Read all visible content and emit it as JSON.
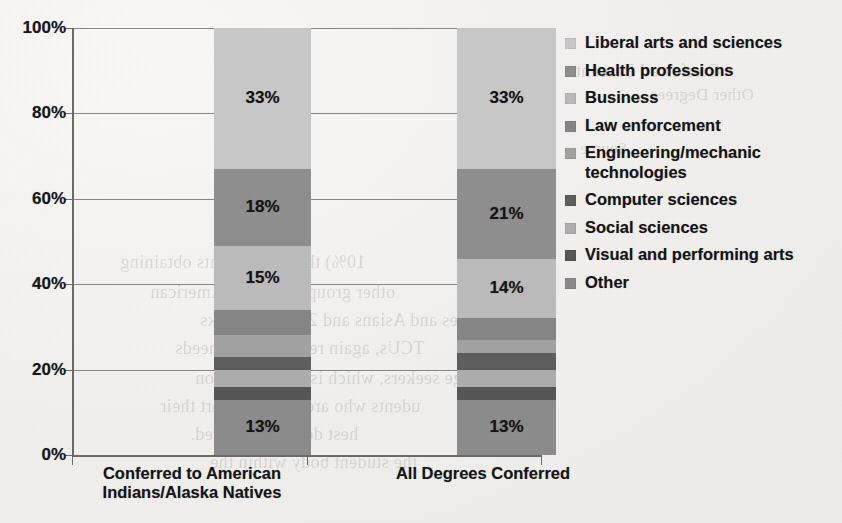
{
  "chart_data": {
    "type": "bar",
    "subtype": "stacked-percent-100",
    "title": "",
    "xlabel": "",
    "ylabel": "",
    "ylim": [
      0,
      100
    ],
    "ytick_labels": [
      "0%",
      "20%",
      "40%",
      "60%",
      "80%",
      "100%"
    ],
    "ytick_values": [
      0,
      20,
      40,
      60,
      80,
      100
    ],
    "grid": true,
    "legend_position": "right",
    "categories": [
      "Conferred to American Indians/Alaska Natives",
      "All Degrees Conferred"
    ],
    "category_lines": [
      [
        "Conferred to American",
        "Indians/Alaska Natives"
      ],
      [
        "All Degrees Conferred"
      ]
    ],
    "series": [
      {
        "name": "Liberal arts and sciences",
        "color": "#c9c9c9",
        "values": [
          33,
          33
        ],
        "labels": [
          "33%",
          "33%"
        ],
        "show_label": [
          true,
          true
        ]
      },
      {
        "name": "Health professions",
        "color": "#8f8f8f",
        "values": [
          18,
          21
        ],
        "labels": [
          "18%",
          "21%"
        ],
        "show_label": [
          true,
          true
        ]
      },
      {
        "name": "Business",
        "color": "#bcbcbc",
        "values": [
          15,
          14
        ],
        "labels": [
          "15%",
          "14%"
        ],
        "show_label": [
          true,
          true
        ]
      },
      {
        "name": "Law enforcement",
        "color": "#878787",
        "values": [
          6,
          5
        ],
        "labels": [
          "6%",
          "5%"
        ],
        "show_label": [
          false,
          false
        ]
      },
      {
        "name": "Engineering/mechanic technologies",
        "color": "#a3a3a3",
        "values": [
          5,
          3
        ],
        "labels": [
          "5%",
          "3%"
        ],
        "show_label": [
          false,
          false
        ]
      },
      {
        "name": "Computer sciences",
        "color": "#5e5e5e",
        "values": [
          3,
          4
        ],
        "labels": [
          "3%",
          "4%"
        ],
        "show_label": [
          false,
          false
        ]
      },
      {
        "name": "Social sciences",
        "color": "#aeaeae",
        "values": [
          4,
          4
        ],
        "labels": [
          "4%",
          "4%"
        ],
        "show_label": [
          false,
          false
        ]
      },
      {
        "name": "Visual and performing arts",
        "color": "#565656",
        "values": [
          3,
          3
        ],
        "labels": [
          "3%",
          "3%"
        ],
        "show_label": [
          false,
          false
        ]
      },
      {
        "name": "Other",
        "color": "#8c8c8c",
        "values": [
          13,
          13
        ],
        "labels": [
          "13%",
          "13%"
        ],
        "show_label": [
          true,
          true
        ]
      }
    ],
    "legend_entries": [
      {
        "label": "Liberal arts and sciences",
        "color": "#c9c9c9"
      },
      {
        "label": "Health professions",
        "color": "#8f8f8f"
      },
      {
        "label": "Business",
        "color": "#bcbcbc"
      },
      {
        "label": "Law enforcement",
        "color": "#878787"
      },
      {
        "label": "Engineering/mechanic technologies",
        "color": "#a3a3a3"
      },
      {
        "label": "Computer sciences",
        "color": "#5e5e5e"
      },
      {
        "label": "Social sciences",
        "color": "#aeaeae"
      },
      {
        "label": "Visual and performing arts",
        "color": "#565656"
      },
      {
        "label": "Other",
        "color": "#8c8c8c"
      }
    ],
    "legend_line_breaks": {
      "Engineering/mechanic technologies": [
        "Engineering/mechanic",
        "technologies"
      ]
    }
  },
  "ghost_text": [
    {
      "text": "Conferred Percent",
      "x": 575,
      "y": 60,
      "size": 19
    },
    {
      "text": "Other Degrees",
      "x": 650,
      "y": 85,
      "size": 17
    },
    {
      "text": "Source",
      "x": 580,
      "y": 140,
      "size": 16
    },
    {
      "text": "10%) than do students obtaining",
      "x": 120,
      "y": 252,
      "size": 18
    },
    {
      "text": "other groups: 20% for American",
      "x": 150,
      "y": 282,
      "size": 18
    },
    {
      "text": "gees and Asians and 20% for Blacks",
      "x": 200,
      "y": 310,
      "size": 18
    },
    {
      "text": "TCUs, again reflecting the needs",
      "x": 175,
      "y": 338,
      "size": 18
    },
    {
      "text": "ege seekers, which is a phenomenon",
      "x": 195,
      "y": 368,
      "size": 18
    },
    {
      "text": "udents who are likely to start their",
      "x": 160,
      "y": 396,
      "size": 18
    },
    {
      "text": "hest degree conferred.",
      "x": 190,
      "y": 424,
      "size": 18
    },
    {
      "text": "the student body within the",
      "x": 210,
      "y": 452,
      "size": 18
    }
  ]
}
